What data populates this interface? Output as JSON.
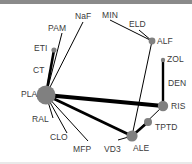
{
  "diagram": {
    "type": "network-graph",
    "title": "",
    "background_color": "#ffffff",
    "node_color": "#808080",
    "edge_color": "#000000",
    "label_color": "#3a3a3a",
    "top_border_color": "#8a8a8a",
    "nodes": [
      {
        "id": "PLA",
        "label": "PLA",
        "x": 46,
        "y": 95,
        "r": 9.5,
        "label_x": 21,
        "label_y": 90
      },
      {
        "id": "ETI",
        "label": "ETI",
        "x": 54,
        "y": 50,
        "r": 2.6,
        "label_x": 34,
        "label_y": 44
      },
      {
        "id": "CT",
        "label": "CT",
        "x": 50,
        "y": 70,
        "r": 0.0,
        "label_x": 33,
        "label_y": 66
      },
      {
        "id": "PAM",
        "label": "PAM",
        "x": 62,
        "y": 33,
        "r": 0.0,
        "label_x": 48,
        "label_y": 24
      },
      {
        "id": "NaF",
        "label": "NaF",
        "x": 83,
        "y": 22,
        "r": 0.0,
        "label_x": 75,
        "label_y": 12
      },
      {
        "id": "MIN",
        "label": "MIN",
        "x": 110,
        "y": 20,
        "r": 0.0,
        "label_x": 102,
        "label_y": 11
      },
      {
        "id": "ELD",
        "label": "ELD",
        "x": 139,
        "y": 30,
        "r": 0.0,
        "label_x": 129,
        "label_y": 20
      },
      {
        "id": "ALF",
        "label": "ALF",
        "x": 152,
        "y": 41,
        "r": 3.4,
        "label_x": 157,
        "label_y": 37
      },
      {
        "id": "ZOL",
        "label": "ZOL",
        "x": 163,
        "y": 60,
        "r": 2.2,
        "label_x": 167,
        "label_y": 55
      },
      {
        "id": "DEN",
        "label": "DEN",
        "x": 163,
        "y": 84,
        "r": 0.0,
        "label_x": 168,
        "label_y": 79
      },
      {
        "id": "RIS",
        "label": "RIS",
        "x": 163,
        "y": 106,
        "r": 5.2,
        "label_x": 171,
        "label_y": 102
      },
      {
        "id": "TPTD",
        "label": "TPTD",
        "x": 148,
        "y": 122,
        "r": 4.0,
        "label_x": 155,
        "label_y": 123
      },
      {
        "id": "ALE",
        "label": "ALE",
        "x": 132,
        "y": 136,
        "r": 5.6,
        "label_x": 133,
        "label_y": 144
      },
      {
        "id": "VD3",
        "label": "VD3",
        "x": 118,
        "y": 140,
        "r": 0.0,
        "label_x": 104,
        "label_y": 145
      },
      {
        "id": "MFP",
        "label": "MFP",
        "x": 88,
        "y": 141,
        "r": 0.0,
        "label_x": 73,
        "label_y": 145
      },
      {
        "id": "CLO",
        "label": "CLO",
        "x": 67,
        "y": 133,
        "r": 0.0,
        "label_x": 50,
        "label_y": 133
      },
      {
        "id": "RAL",
        "label": "RAL",
        "x": 53,
        "y": 118,
        "r": 0.0,
        "label_x": 32,
        "label_y": 115
      }
    ],
    "edges": [
      {
        "source": "PLA",
        "target": "ETI",
        "width": 2.6
      },
      {
        "source": "PLA",
        "target": "CT",
        "width": 1.2
      },
      {
        "source": "PLA",
        "target": "PAM",
        "width": 1.0
      },
      {
        "source": "PLA",
        "target": "NaF",
        "width": 1.0
      },
      {
        "source": "PLA",
        "target": "RAL",
        "width": 1.0
      },
      {
        "source": "PLA",
        "target": "CLO",
        "width": 1.0
      },
      {
        "source": "PLA",
        "target": "MFP",
        "width": 1.0
      },
      {
        "source": "PLA",
        "target": "RIS",
        "width": 4.2
      },
      {
        "source": "PLA",
        "target": "ALE",
        "width": 2.8
      },
      {
        "source": "MIN",
        "target": "ALF",
        "width": 1.0
      },
      {
        "source": "ELD",
        "target": "ALF",
        "width": 1.0
      },
      {
        "source": "ALF",
        "target": "ALE",
        "width": 1.0
      },
      {
        "source": "ZOL",
        "target": "RIS",
        "width": 2.4
      },
      {
        "source": "ALE",
        "target": "TPTD",
        "width": 2.6
      },
      {
        "source": "ALE",
        "target": "VD3",
        "width": 1.0
      },
      {
        "source": "ALE",
        "target": "RIS",
        "width": 1.0
      }
    ]
  }
}
